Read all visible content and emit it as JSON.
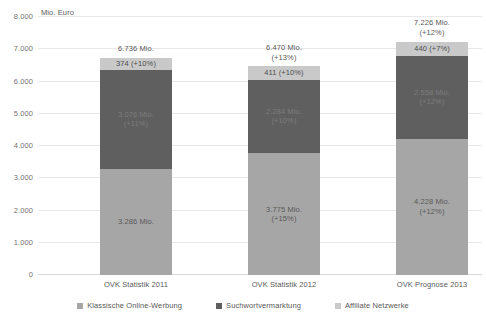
{
  "chart_data": {
    "type": "bar",
    "stacked": true,
    "title": "",
    "subtitle": "",
    "xlabel": "",
    "ylabel": "Mio. Euro",
    "ylim": [
      0,
      8000
    ],
    "ytick_step": 1000,
    "ytick_labels": [
      "8.000",
      "7.000",
      "6.000",
      "5.000",
      "4.000",
      "3.000",
      "2.000",
      "1.000",
      "0"
    ],
    "ytick_values": [
      8000,
      7000,
      6000,
      5000,
      4000,
      3000,
      2000,
      1000,
      0
    ],
    "grid": true,
    "legend_position": "bottom",
    "categories": [
      "OVK Statistik 2011",
      "OVK Statistik 2012",
      "OVK Prognose 2013"
    ],
    "series": [
      {
        "name": "Klassische Online-Werbung",
        "color": "#a6a6a6",
        "values": [
          3286,
          3775,
          4228
        ],
        "labels": [
          "3.286 Mio.",
          "3.775 Mio.\n(+15%)",
          "4.228 Mio.\n(+12%)"
        ]
      },
      {
        "name": "Suchwortvermarktung",
        "color": "#5f5f5f",
        "values": [
          3076,
          2284,
          2558
        ],
        "labels": [
          "3.076 Mio.\n(+11%)",
          "2.284 Mio.\n(+10%)",
          "2.558 Mio.\n(+12%)"
        ]
      },
      {
        "name": "Affiliate Netzwerke",
        "color": "#c9c9c9",
        "values": [
          374,
          411,
          440
        ],
        "labels": [
          "374  (+10%)",
          "411  (+10%)",
          "440 (+7%)"
        ]
      }
    ],
    "totals": [
      6736,
      6470,
      7226
    ],
    "total_labels": [
      "6.736 Mio.",
      "6.470 Mio.\n(+13%)",
      "7.226 Mio.\n(+12%)"
    ]
  },
  "axis": {
    "unit_caption": "Mio. Euro"
  },
  "legend": {
    "items": [
      {
        "label": "Klassische Online-Werbung",
        "color": "#a6a6a6"
      },
      {
        "label": "Suchwortvermarktung",
        "color": "#5f5f5f"
      },
      {
        "label": "Affiliate Netzwerke",
        "color": "#c9c9c9"
      }
    ]
  }
}
